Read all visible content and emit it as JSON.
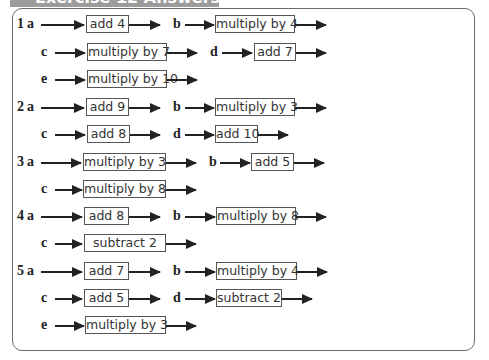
{
  "header": {
    "title": "Exercise 12 Answers"
  },
  "questions": [
    {
      "number": "1",
      "parts": [
        {
          "label": "a",
          "operation": "add 4"
        },
        {
          "label": "b",
          "operation": "multiply by 4"
        },
        {
          "label": "c",
          "operation": "multiply by 7"
        },
        {
          "label": "d",
          "operation": "add 7"
        },
        {
          "label": "e",
          "operation": "multiply by 10"
        }
      ]
    },
    {
      "number": "2",
      "parts": [
        {
          "label": "a",
          "operation": "add 9"
        },
        {
          "label": "b",
          "operation": "multiply by 3"
        },
        {
          "label": "c",
          "operation": "add 8"
        },
        {
          "label": "d",
          "operation": "add 10"
        }
      ]
    },
    {
      "number": "3",
      "parts": [
        {
          "label": "a",
          "operation": "multiply by 3"
        },
        {
          "label": "b",
          "operation": "add 5"
        },
        {
          "label": "c",
          "operation": "multiply by 8"
        }
      ]
    },
    {
      "number": "4",
      "parts": [
        {
          "label": "a",
          "operation": "add 8"
        },
        {
          "label": "b",
          "operation": "multiply by 8"
        },
        {
          "label": "c",
          "operation": "subtract 2"
        }
      ]
    },
    {
      "number": "5",
      "parts": [
        {
          "label": "a",
          "operation": "add 7"
        },
        {
          "label": "b",
          "operation": "multiply by 4"
        },
        {
          "label": "c",
          "operation": "add 5"
        },
        {
          "label": "d",
          "operation": "subtract 2"
        },
        {
          "label": "e",
          "operation": "multiply by 3"
        }
      ]
    }
  ]
}
